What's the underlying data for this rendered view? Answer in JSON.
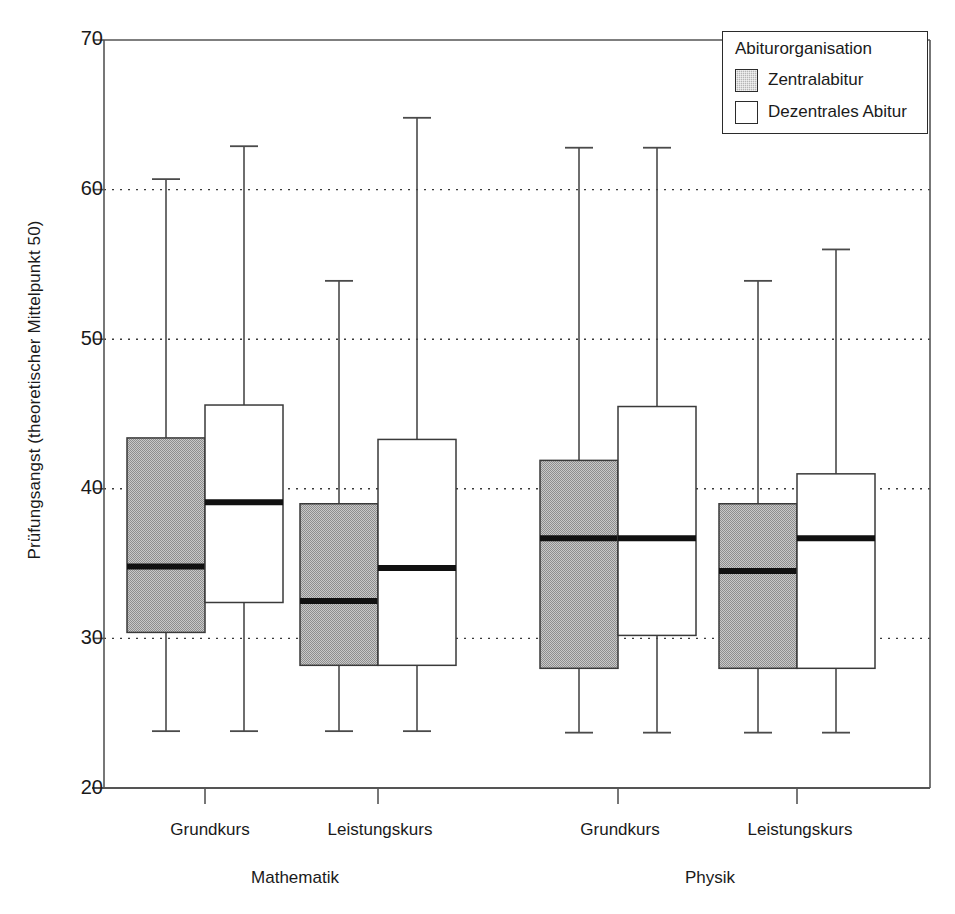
{
  "chart_data": {
    "type": "box",
    "title": "",
    "xlabel": "",
    "ylabel": "Prüfungsangst (theoretischer Mittelpunkt 50)",
    "ylim": [
      20,
      70
    ],
    "yticks": [
      20,
      30,
      40,
      50,
      60,
      70
    ],
    "ytick_labels": [
      "20",
      "30",
      "40",
      "50",
      "60",
      "70"
    ],
    "grid": "horizontal-dotted",
    "legend_position": "top-right",
    "legend_title": "Abiturorganisation",
    "categories": [
      "Grundkurs",
      "Leistungskurs",
      "Grundkurs",
      "Leistungskurs"
    ],
    "group_labels": [
      "Mathematik",
      "Physik"
    ],
    "series": [
      {
        "name": "Zentralabitur",
        "color": "#b6b6b6",
        "boxes": [
          {
            "group": "Mathematik",
            "category": "Grundkurs",
            "whisker_low": 23.8,
            "q1": 30.4,
            "median": 34.8,
            "q3": 43.4,
            "whisker_high": 60.7
          },
          {
            "group": "Mathematik",
            "category": "Leistungskurs",
            "whisker_low": 23.8,
            "q1": 28.2,
            "median": 32.5,
            "q3": 39.0,
            "whisker_high": 53.9
          },
          {
            "group": "Physik",
            "category": "Grundkurs",
            "whisker_low": 23.7,
            "q1": 28.0,
            "median": 36.7,
            "q3": 41.9,
            "whisker_high": 62.8
          },
          {
            "group": "Physik",
            "category": "Leistungskurs",
            "whisker_low": 23.7,
            "q1": 28.0,
            "median": 34.5,
            "q3": 39.0,
            "whisker_high": 53.9
          }
        ]
      },
      {
        "name": "Dezentrales Abitur",
        "color": "#ffffff",
        "boxes": [
          {
            "group": "Mathematik",
            "category": "Grundkurs",
            "whisker_low": 23.8,
            "q1": 32.4,
            "median": 39.1,
            "q3": 45.6,
            "whisker_high": 62.9
          },
          {
            "group": "Mathematik",
            "category": "Leistungskurs",
            "whisker_low": 23.8,
            "q1": 28.2,
            "median": 34.7,
            "q3": 43.3,
            "whisker_high": 64.8
          },
          {
            "group": "Physik",
            "category": "Grundkurs",
            "whisker_low": 23.7,
            "q1": 30.2,
            "median": 36.7,
            "q3": 45.5,
            "whisker_high": 62.8
          },
          {
            "group": "Physik",
            "category": "Leistungskurs",
            "whisker_low": 23.7,
            "q1": 28.0,
            "median": 36.7,
            "q3": 41.0,
            "whisker_high": 56.0
          }
        ]
      }
    ]
  },
  "axis": {
    "y_label": "Prüfungsangst (theoretischer Mittelpunkt 50)",
    "y_ticks": [
      {
        "value": 70,
        "label": "70"
      },
      {
        "value": 60,
        "label": "60"
      },
      {
        "value": 50,
        "label": "50"
      },
      {
        "value": 40,
        "label": "40"
      },
      {
        "value": 30,
        "label": "30"
      },
      {
        "value": 20,
        "label": "20"
      }
    ],
    "x_categories": [
      {
        "label": "Grundkurs"
      },
      {
        "label": "Leistungskurs"
      },
      {
        "label": "Grundkurs"
      },
      {
        "label": "Leistungskurs"
      }
    ],
    "x_groups": [
      {
        "label": "Mathematik"
      },
      {
        "label": "Physik"
      }
    ]
  },
  "legend": {
    "title": "Abiturorganisation",
    "items": [
      {
        "label": "Zentralabitur",
        "swatch": "gray"
      },
      {
        "label": "Dezentrales Abitur",
        "swatch": "white"
      }
    ]
  }
}
